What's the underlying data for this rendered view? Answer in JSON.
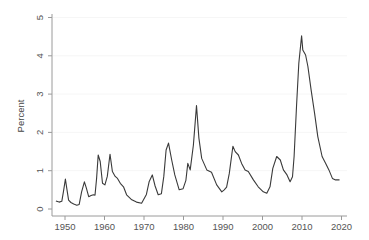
{
  "chart_data": {
    "type": "line",
    "title": "",
    "xlabel": "",
    "ylabel": "Percent",
    "xlim": [
      1946.5,
      2021.5
    ],
    "ylim": [
      0,
      5
    ],
    "x_ticks": [
      1950,
      1960,
      1970,
      1980,
      1990,
      2000,
      2010,
      2020
    ],
    "y_ticks": [
      0,
      1,
      2,
      3,
      4,
      5
    ],
    "grid": false,
    "legend": null,
    "line_color": "#3a3a3a",
    "series": [
      {
        "name": "Percent",
        "x": [
          1947.7,
          1948.5,
          1949.2,
          1949.6,
          1950.1,
          1950.5,
          1950.9,
          1951.5,
          1952.2,
          1953.0,
          1953.6,
          1954.2,
          1954.9,
          1955.4,
          1956.0,
          1956.6,
          1957.2,
          1957.6,
          1958.0,
          1958.4,
          1958.9,
          1959.5,
          1960.1,
          1960.7,
          1961.4,
          1962.0,
          1962.7,
          1963.3,
          1964.0,
          1964.8,
          1965.6,
          1966.9,
          1968.1,
          1969.4,
          1970.6,
          1971.3,
          1972.1,
          1972.8,
          1973.6,
          1974.4,
          1975.0,
          1975.6,
          1976.2,
          1977.0,
          1977.8,
          1978.9,
          1979.9,
          1980.6,
          1981.1,
          1981.7,
          1982.5,
          1983.3,
          1983.9,
          1984.6,
          1985.9,
          1987.1,
          1988.4,
          1989.7,
          1990.3,
          1990.9,
          1991.6,
          1992.5,
          1993.1,
          1993.9,
          1994.7,
          1995.6,
          1996.4,
          1997.7,
          1998.9,
          2000.2,
          2001.1,
          2001.9,
          2002.6,
          2003.6,
          2004.5,
          2005.3,
          2006.2,
          2007.0,
          2007.6,
          2008.0,
          2008.6,
          2009.2,
          2009.9,
          2010.2,
          2010.9,
          2011.5,
          2012.3,
          2013.2,
          2014.0,
          2015.1,
          2016.0,
          2016.8,
          2017.7,
          2018.5,
          2019.5
        ],
        "values": [
          0.21,
          0.18,
          0.2,
          0.45,
          0.78,
          0.5,
          0.23,
          0.17,
          0.13,
          0.1,
          0.12,
          0.45,
          0.71,
          0.55,
          0.32,
          0.35,
          0.37,
          0.36,
          0.8,
          1.41,
          1.24,
          0.67,
          0.63,
          0.85,
          1.43,
          0.98,
          0.85,
          0.8,
          0.67,
          0.58,
          0.37,
          0.24,
          0.18,
          0.15,
          0.38,
          0.71,
          0.89,
          0.6,
          0.37,
          0.4,
          0.85,
          1.54,
          1.72,
          1.28,
          0.89,
          0.5,
          0.53,
          0.75,
          1.19,
          1.02,
          1.67,
          2.7,
          1.85,
          1.32,
          1.02,
          0.96,
          0.63,
          0.45,
          0.5,
          0.57,
          0.93,
          1.64,
          1.5,
          1.41,
          1.19,
          1.02,
          0.98,
          0.76,
          0.58,
          0.45,
          0.41,
          0.58,
          1.06,
          1.37,
          1.28,
          1.02,
          0.89,
          0.71,
          0.84,
          1.37,
          2.67,
          3.8,
          4.52,
          4.15,
          4.02,
          3.72,
          3.11,
          2.5,
          1.89,
          1.37,
          1.19,
          1.02,
          0.8,
          0.76,
          0.76
        ]
      }
    ]
  }
}
